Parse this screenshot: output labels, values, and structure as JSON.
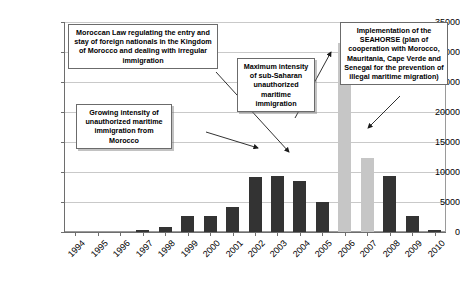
{
  "chart_data": {
    "type": "bar",
    "title": "",
    "subtitle": "",
    "xlabel": "",
    "ylabel": "",
    "ylim": [
      0,
      35000
    ],
    "ytick_step": 5000,
    "grid": true,
    "legend": "none",
    "categories": [
      "1994",
      "1995",
      "1996",
      "1997",
      "1998",
      "1999",
      "2000",
      "2001",
      "2002",
      "2003",
      "2004",
      "2005",
      "2006",
      "2007",
      "2008",
      "2009",
      "2010"
    ],
    "values": [
      0,
      0,
      0,
      300,
      900,
      2700,
      2700,
      4200,
      9200,
      9400,
      8500,
      5000,
      31500,
      12300,
      9300,
      2700,
      300
    ],
    "bar_colors": [
      "dark",
      "dark",
      "dark",
      "dark",
      "dark",
      "dark",
      "dark",
      "dark",
      "dark",
      "dark",
      "dark",
      "dark",
      "light",
      "light",
      "dark",
      "dark",
      "dark"
    ],
    "ytick_labels": [
      "35000",
      "30000",
      "25000",
      "20000",
      "15000",
      "10000",
      "5000",
      "0"
    ],
    "ytick_values": [
      35000,
      30000,
      25000,
      20000,
      15000,
      10000,
      5000,
      0
    ],
    "palette": {
      "dark": "#333333",
      "light": "#c6c6c6",
      "grid": "#c9c9c9",
      "axis": "#6e6e6e",
      "annotation_border": "#6b6b6b",
      "background": "#ffffff"
    },
    "annotations": [
      {
        "id": "moroccan-law",
        "text": "Moroccan Law regulating the entry and stay of foreign nationals in the Kingdom of Morocco and dealing with irregular immigration",
        "points_to_category": "2003"
      },
      {
        "id": "growing-intensity",
        "text": "Growing intensity of unauthorized maritime immigration from Morocco",
        "points_to_category": "2002"
      },
      {
        "id": "maximum-intensity",
        "text": "Maximum intensity of sub-Saharan unauthorized maritime immigration",
        "points_to_category": "2006"
      },
      {
        "id": "seahorse",
        "text": "Implementation of the SEAHORSE (plan of cooperation with Morocco, Mauritania, Cape Verde and Senegal for the prevention of illegal maritime migration)",
        "points_to_category": "2007"
      }
    ]
  }
}
